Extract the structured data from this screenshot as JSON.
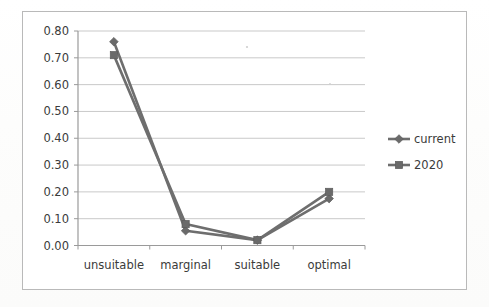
{
  "chart_data": {
    "type": "line",
    "title": "",
    "xlabel": "",
    "ylabel": "",
    "categories": [
      "unsuitable",
      "marginal",
      "suitable",
      "optimal"
    ],
    "series": [
      {
        "name": "current",
        "marker": "diamond",
        "color": "#6a6a6a",
        "values": [
          0.76,
          0.055,
          0.02,
          0.175
        ]
      },
      {
        "name": "2020",
        "marker": "square",
        "color": "#6a6a6a",
        "values": [
          0.71,
          0.08,
          0.02,
          0.2
        ]
      }
    ],
    "ylim": [
      0.0,
      0.8
    ],
    "ytick_step": 0.1,
    "ytick_labels": [
      "0.00",
      "0.10",
      "0.20",
      "0.30",
      "0.40",
      "0.50",
      "0.60",
      "0.70",
      "0.80"
    ],
    "grid": true,
    "legend_position": "right",
    "legend_entries": [
      "current",
      "2020"
    ]
  },
  "axes": {
    "y_labels": [
      "0.80",
      "0.70",
      "0.60",
      "0.50",
      "0.40",
      "0.30",
      "0.20",
      "0.10",
      "0.00"
    ],
    "x_labels": [
      "unsuitable",
      "marginal",
      "suitable",
      "optimal"
    ]
  },
  "legend": {
    "items": [
      {
        "label": "current",
        "marker": "diamond-marker-icon"
      },
      {
        "label": "2020",
        "marker": "square-marker-icon"
      }
    ]
  },
  "colors": {
    "line": "#6e6e6e",
    "marker": "#6a6a6a",
    "grid": "#c9c9c9",
    "axis": "#9a9a9a",
    "text": "#3b3b3b",
    "frame": "#b9b9b9",
    "background": "#ffffff"
  }
}
